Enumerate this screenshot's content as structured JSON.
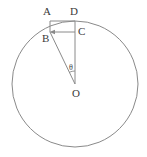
{
  "figure": {
    "width": 147,
    "height": 157,
    "background_color": "#ffffff",
    "stroke_color": "#8a8a8a",
    "label_color": "#3a3a3a"
  },
  "chart_data": {
    "type": "diagram",
    "coordinate_space": {
      "units": "pixels",
      "origin": "top-left",
      "width": 147,
      "height": 157
    },
    "circle": {
      "name": "main-circle",
      "center_label": "O",
      "center": {
        "x": 75,
        "y": 84
      },
      "radius": 63,
      "stroke": "#8a8a8a",
      "fill": "none"
    },
    "points": [
      {
        "label": "A",
        "x": 50,
        "y": 21,
        "on_circle": false,
        "label_offset": {
          "dx": -5,
          "dy": -6
        }
      },
      {
        "label": "D",
        "x": 75,
        "y": 21,
        "on_circle": true,
        "label_offset": {
          "dx": -2,
          "dy": -6
        }
      },
      {
        "label": "B",
        "x": 50,
        "y": 32,
        "on_circle": true,
        "label_offset": {
          "dx": -5,
          "dy": 9
        }
      },
      {
        "label": "C",
        "x": 75,
        "y": 32,
        "on_circle": false,
        "label_offset": {
          "dx": 4,
          "dy": 4
        }
      },
      {
        "label": "O",
        "x": 75,
        "y": 84,
        "on_circle": false,
        "label_offset": {
          "dx": -2,
          "dy": 12
        }
      }
    ],
    "segments": [
      {
        "name": "segment-AD",
        "from": "A",
        "to": "D",
        "x1": 50,
        "y1": 21,
        "x2": 75,
        "y2": 21,
        "arrow": "none"
      },
      {
        "name": "segment-AB",
        "from": "A",
        "to": "B",
        "x1": 50,
        "y1": 21,
        "x2": 50,
        "y2": 32,
        "arrow": "none"
      },
      {
        "name": "segment-CB",
        "from": "C",
        "to": "B",
        "x1": 75,
        "y1": 32,
        "x2": 50,
        "y2": 32,
        "arrow": "end"
      },
      {
        "name": "segment-DO",
        "from": "D",
        "to": "O",
        "x1": 75,
        "y1": 21,
        "x2": 75,
        "y2": 84,
        "arrow": "none"
      },
      {
        "name": "segment-BO",
        "from": "B",
        "to": "O",
        "x1": 50,
        "y1": 32,
        "x2": 75,
        "y2": 84,
        "arrow": "none"
      }
    ],
    "angles": [
      {
        "name": "angle-theta-at-O",
        "label": "θ",
        "vertex": "O",
        "vertex_x": 75,
        "vertex_y": 84,
        "ray_1": "OB",
        "ray_2": "OD",
        "arc_radius": 13,
        "label_x": 70,
        "label_y": 64
      }
    ],
    "xlabel": "",
    "ylabel": "",
    "grid": false,
    "legend": false
  },
  "labels": {
    "a": "A",
    "b": "B",
    "c": "C",
    "d": "D",
    "o": "O",
    "theta": "θ"
  }
}
